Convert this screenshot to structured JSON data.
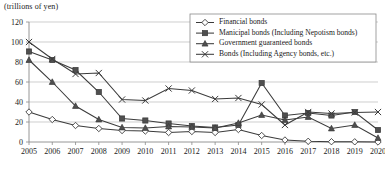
{
  "axis_unit_label": "(trillions of yen)",
  "legend": {
    "entries": [
      {
        "label": "Financial bonds",
        "marker": "open-diamond-marker"
      },
      {
        "label": "Manicipal bonds (Including Nepotism bonds)",
        "marker": "solid-square-marker"
      },
      {
        "label": "Government guaranteed bonds",
        "marker": "solid-triangle-marker"
      },
      {
        "label": "Bonds (Including Agency bonds, etc.)",
        "marker": "cross-marker"
      }
    ]
  },
  "colors": {
    "line": "#3b3b3b",
    "grid": "#b9b9b9",
    "axis": "#8a8a8a",
    "marker_fill": "#4f4f4f",
    "background": "#ffffff"
  },
  "chart_data": {
    "type": "line",
    "title": "",
    "subtitle": "",
    "xlabel": "",
    "ylabel": "(trillions of yen)",
    "ylim": [
      0,
      120
    ],
    "yticks": [
      0,
      20,
      40,
      60,
      80,
      100,
      120
    ],
    "grid": true,
    "legend_position": "top-right",
    "categories": [
      "2005",
      "2006",
      "2007",
      "2008",
      "2009",
      "2010",
      "2011",
      "2012",
      "2013",
      "2014",
      "2015",
      "2016",
      "2017",
      "2018",
      "2019",
      "2020"
    ],
    "series": [
      {
        "name": "Financial bonds",
        "marker": "open-diamond",
        "values": [
          30,
          22.5,
          16.5,
          13.5,
          11.5,
          11,
          9.5,
          10.5,
          9.5,
          12.5,
          6.5,
          2,
          0.7,
          0.3,
          0.2,
          0
        ]
      },
      {
        "name": "Manicipal bonds (Including Nepotism bonds)",
        "marker": "solid-square",
        "values": [
          90.5,
          82,
          72,
          50,
          23.5,
          21.5,
          18.5,
          16,
          14.5,
          17,
          59,
          26.5,
          29,
          26.5,
          30,
          12
        ]
      },
      {
        "name": "Government guaranteed bonds",
        "marker": "solid-triangle",
        "values": [
          82,
          60,
          36,
          22.5,
          14.5,
          14,
          15.5,
          15,
          14,
          19,
          27,
          22,
          25,
          13.5,
          17,
          4
        ]
      },
      {
        "name": "Bonds (Including Agency bonds, etc.)",
        "marker": "cross",
        "values": [
          100,
          83,
          68,
          69,
          42.5,
          41.5,
          53.5,
          51.5,
          43,
          44,
          37.5,
          17,
          30,
          28.5,
          29.5,
          30
        ]
      }
    ]
  }
}
